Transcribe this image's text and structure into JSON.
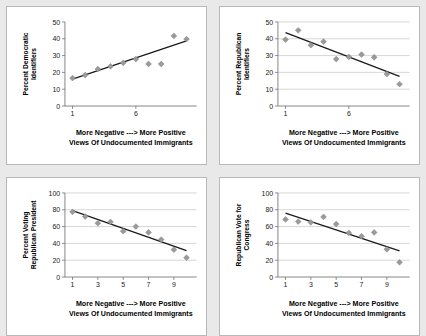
{
  "figure": {
    "background_color": "#e9e9e9",
    "panel_background": "#ffffff",
    "marker_color": "#9a9a9a",
    "line_color": "#1a1a1a",
    "grid_color": "#d4d4d4"
  },
  "shared": {
    "xlabel_line1": "More Negative   ---> More Positive",
    "xlabel_line2": "Views Of Undocumented Immigrants"
  },
  "chart_data": [
    {
      "type": "scatter",
      "panel": "top-left",
      "title": "",
      "ylabel": "Percent Democratic Identifiers",
      "ylabel_line1": "Percent Democratic",
      "ylabel_line2": "Identifiers",
      "xlabel": "More Negative   ---> More Positive Views Of Undocumented Immigrants",
      "xlim": [
        0.4,
        10.8
      ],
      "ylim": [
        0,
        50
      ],
      "yticks": [
        0,
        10,
        20,
        30,
        40,
        50
      ],
      "xticks": [
        1,
        6
      ],
      "grid": false,
      "x": [
        1,
        2,
        3,
        4,
        5,
        6,
        7,
        8,
        9,
        10
      ],
      "values": [
        16.6,
        18.4,
        22.0,
        23.6,
        25.7,
        27.9,
        25.0,
        25.0,
        41.7,
        39.8
      ],
      "trend_line": {
        "x_start": 1,
        "y_start": 16.0,
        "x_end": 10,
        "y_end": 38.8
      }
    },
    {
      "type": "scatter",
      "panel": "top-right",
      "title": "",
      "ylabel": "Percent Republican Identifiers",
      "ylabel_line1": "Percent Republican",
      "ylabel_line2": "Identifiers",
      "xlabel": "More Negative   ---> More Positive Views Of Undocumented Immigrants",
      "xlim": [
        0.4,
        10.8
      ],
      "ylim": [
        0,
        50
      ],
      "yticks": [
        0,
        10,
        20,
        30,
        40,
        50
      ],
      "xticks": [
        1,
        6
      ],
      "grid": true,
      "x": [
        1,
        2,
        3,
        4,
        5,
        6,
        7,
        8,
        9,
        10
      ],
      "values": [
        39.5,
        45.0,
        36.2,
        38.3,
        27.9,
        29.2,
        30.6,
        29.0,
        19.0,
        13.0
      ],
      "trend_line": {
        "x_start": 1,
        "y_start": 43.6,
        "x_end": 10,
        "y_end": 17.6
      }
    },
    {
      "type": "scatter",
      "panel": "bottom-left",
      "title": "",
      "ylabel": "Percent Voting Republican President",
      "ylabel_line1": "Percent Voting",
      "ylabel_line2": "Republican President",
      "xlabel": "More Negative   ---> More Positive Views Of Undocumented Immigrants",
      "xlim": [
        0.4,
        10.8
      ],
      "ylim": [
        0,
        100
      ],
      "yticks": [
        0,
        20,
        40,
        60,
        80,
        100
      ],
      "xticks": [
        1,
        3,
        5,
        7,
        9
      ],
      "grid": true,
      "x": [
        1,
        2,
        3,
        4,
        5,
        6,
        7,
        8,
        9,
        10
      ],
      "values": [
        77.5,
        72.0,
        64.0,
        65.5,
        54.5,
        60.0,
        53.0,
        44.5,
        32.5,
        23.0
      ],
      "trend_line": {
        "x_start": 1,
        "y_start": 79.0,
        "x_end": 10,
        "y_end": 31.5
      }
    },
    {
      "type": "scatter",
      "panel": "bottom-right",
      "title": "",
      "ylabel": "Republican Vote for Congress",
      "ylabel_line1": "Republican Vote for",
      "ylabel_line2": "Congress",
      "xlabel": "More Negative   ---> More Positive Views Of Undocumented Immigrants",
      "xlim": [
        0.4,
        10.8
      ],
      "ylim": [
        0,
        100
      ],
      "yticks": [
        0,
        20,
        40,
        60,
        80,
        100
      ],
      "xticks": [
        1,
        3,
        5,
        7,
        9
      ],
      "grid": true,
      "x": [
        1,
        2,
        3,
        4,
        5,
        6,
        7,
        8,
        9,
        10
      ],
      "values": [
        68.5,
        66.0,
        65.0,
        71.5,
        63.0,
        52.5,
        48.5,
        53.0,
        33.0,
        17.5
      ],
      "trend_line": {
        "x_start": 1,
        "y_start": 76.0,
        "x_end": 10,
        "y_end": 31.0
      }
    }
  ]
}
